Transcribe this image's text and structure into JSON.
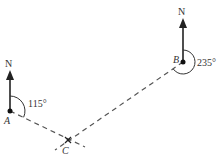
{
  "diagram": {
    "points": {
      "A": {
        "label": "A",
        "x": 10,
        "y": 111
      },
      "B": {
        "label": "B",
        "x": 183,
        "y": 62
      },
      "C": {
        "label": "C",
        "x": 68,
        "y": 140
      }
    },
    "north_labels": {
      "A": "N",
      "B": "N"
    },
    "bearings": {
      "A_to_C": "115°",
      "B_to_C": "235°"
    },
    "colors": {
      "ink": "#222222",
      "line": "#555555"
    }
  }
}
